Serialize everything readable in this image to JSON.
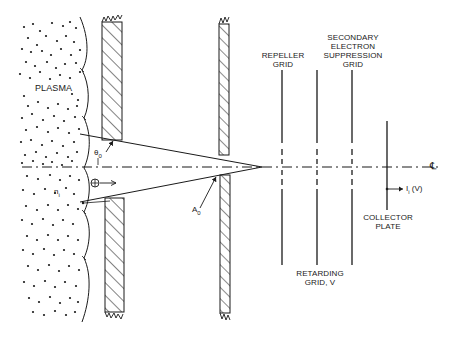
{
  "diagram": {
    "type": "retarding-potential-analyzer-schematic",
    "stroke_color": "#1a1a1a",
    "background": "#ffffff",
    "labels": {
      "plasma": "PLASMA",
      "density": "n",
      "density_sub": "i",
      "angle": "θ",
      "angle_sub": "0",
      "aperture": "A",
      "aperture_sub": "0",
      "repeller_line1": "REPELLER",
      "repeller_line2": "GRID",
      "suppression_line1": "SECONDARY",
      "suppression_line2": "ELECTRON",
      "suppression_line3": "SUPPRESSION",
      "suppression_line4": "GRID",
      "retarding_line1": "RETARDING",
      "retarding_line2": "GRID, V",
      "collector_line1": "COLLECTOR",
      "collector_line2": "PLATE",
      "current": "I",
      "current_sub": "i",
      "current_arg": " (V)",
      "centerline": "℄",
      "ion_symbol": "⊕"
    },
    "components": [
      {
        "name": "plasma-region",
        "x_range": [
          5,
          65
        ]
      },
      {
        "name": "front-wall",
        "x_range": [
          102,
          122
        ],
        "aperture_y": [
          140,
          198
        ]
      },
      {
        "name": "rear-wall-aperture",
        "x_range": [
          219,
          229
        ],
        "aperture_y": [
          155,
          175
        ]
      },
      {
        "name": "repeller-grid",
        "x": 282,
        "y_range": [
          70,
          265
        ]
      },
      {
        "name": "retarding-grid",
        "x": 317,
        "y_range": [
          70,
          265
        ]
      },
      {
        "name": "suppression-grid",
        "x": 352,
        "y_range": [
          70,
          265
        ]
      },
      {
        "name": "collector-plate",
        "x": 387,
        "y_range": [
          121,
          210
        ]
      }
    ],
    "centerline_y": 167
  }
}
